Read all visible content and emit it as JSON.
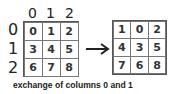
{
  "left_matrix": {
    "column_labels": [
      "0",
      "1",
      "2"
    ],
    "row_labels": [
      "0",
      "1",
      "2"
    ],
    "cells": [
      [
        "0",
        "1",
        "2"
      ],
      [
        "3",
        "4",
        "5"
      ],
      [
        "6",
        "7",
        "8"
      ]
    ]
  },
  "right_matrix": {
    "cells": [
      [
        "1",
        "0",
        "2"
      ],
      [
        "4",
        "3",
        "5"
      ],
      [
        "7",
        "6",
        "8"
      ]
    ]
  },
  "arrow": {
    "icon": "right-arrow-icon"
  },
  "caption": "exchange of columns 0 and 1"
}
